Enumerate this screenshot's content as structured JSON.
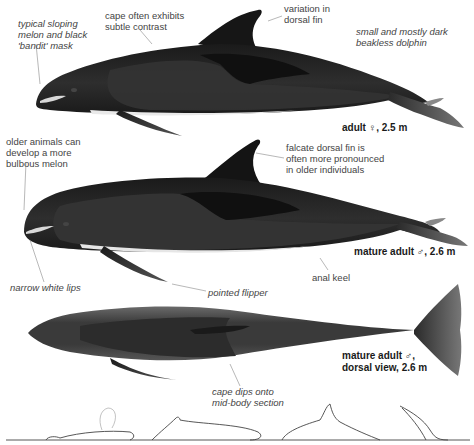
{
  "figures": [
    {
      "id": "adult-female-lateral",
      "caption": "adult ♀, 2.5 m",
      "annotations": {
        "melon": "typical sloping\nmelon and black\n'bandit' mask",
        "cape": "cape often exhibits\nsubtle contrast",
        "dorsal": "variation in\ndorsal fin",
        "summary": "small and mostly dark\nbeakless dolphin"
      }
    },
    {
      "id": "mature-male-lateral",
      "caption": "mature adult ♂, 2.6 m",
      "annotations": {
        "melon": "older animals can\ndevelop a more\nbulbous melon",
        "dorsal": "falcate dorsal fin is\noften more pronounced\nin older individuals",
        "lips": "narrow white lips",
        "flipper": "pointed flipper",
        "keel": "anal keel"
      }
    },
    {
      "id": "mature-male-dorsal",
      "caption": "mature adult ♂,\ndorsal view, 2.6 m",
      "annotations": {
        "cape": "cape dips onto\nmid-body section"
      }
    }
  ],
  "surfacing_sequence": [
    "head-rise",
    "back-surfacing",
    "arched-dive",
    "steep-dive"
  ],
  "colors": {
    "body_dark": "#1c1c1c",
    "cape": "#111111",
    "flank": "#3a3a3a",
    "belly": "#e8e8e8",
    "leader_line": "#888888"
  }
}
